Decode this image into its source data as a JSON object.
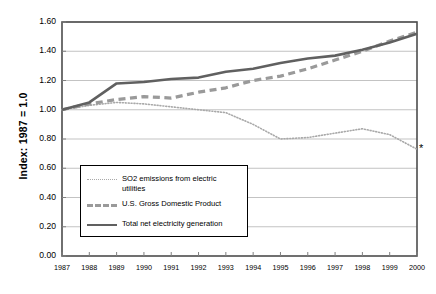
{
  "chart_data": {
    "type": "line",
    "title": "",
    "xlabel": "",
    "ylabel": "Index: 1987 = 1.0",
    "x": [
      1987,
      1988,
      1989,
      1990,
      1991,
      1992,
      1993,
      1994,
      1995,
      1996,
      1997,
      1998,
      1999,
      2000
    ],
    "categories": [
      "1987",
      "1988",
      "1989",
      "1990",
      "1991",
      "1992",
      "1993",
      "1994",
      "1995",
      "1996",
      "1997",
      "1998",
      "1999",
      "2000"
    ],
    "xlim": [
      1987,
      2000
    ],
    "ylim": [
      0.0,
      1.6
    ],
    "yticks": [
      "0.00",
      "0.20",
      "0.40",
      "0.60",
      "0.80",
      "1.00",
      "1.20",
      "1.40",
      "1.60"
    ],
    "ytick_values": [
      0.0,
      0.2,
      0.4,
      0.6,
      0.8,
      1.0,
      1.2,
      1.4,
      1.6
    ],
    "grid": true,
    "grid_axis": "y",
    "legend_position": "lower-left-inside",
    "series": [
      {
        "name": "SO2 emissions from electric utilities",
        "style": "dotted",
        "color": "#a9a9a9",
        "values": [
          1.0,
          1.03,
          1.05,
          1.04,
          1.02,
          1.0,
          0.98,
          0.9,
          0.8,
          0.81,
          0.84,
          0.87,
          0.83,
          0.73
        ],
        "endpoint_marker": "asterisk"
      },
      {
        "name": "U.S. Gross Domestic Product",
        "style": "dashed",
        "color": "#9a9a9a",
        "values": [
          1.0,
          1.04,
          1.07,
          1.09,
          1.08,
          1.12,
          1.15,
          1.2,
          1.23,
          1.28,
          1.34,
          1.4,
          1.47,
          1.53
        ]
      },
      {
        "name": "Total net electricity generation",
        "style": "solid",
        "color": "#606060",
        "values": [
          1.0,
          1.05,
          1.18,
          1.19,
          1.21,
          1.22,
          1.26,
          1.28,
          1.32,
          1.35,
          1.37,
          1.41,
          1.46,
          1.52
        ]
      }
    ],
    "annotations": [
      {
        "name": "so2-endpoint-asterisk",
        "symbol": "*",
        "x": 2000,
        "y": 0.73
      }
    ]
  },
  "legend": {
    "entries": [
      {
        "label": "SO2 emissions from electric utilities"
      },
      {
        "label": "U.S. Gross Domestic Product"
      },
      {
        "label": "Total net electricity generation"
      }
    ]
  }
}
